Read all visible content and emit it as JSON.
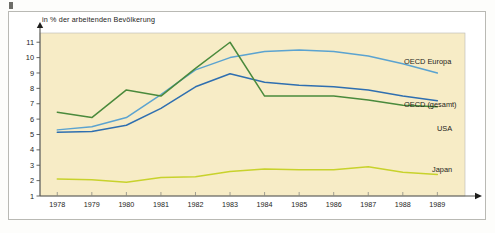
{
  "figure": {
    "corner_mark": "figure-marker",
    "background_color": "#ffffff",
    "plot_background_color": "#f7ecc6",
    "frame_color": "#b9b9b4"
  },
  "chart_data": {
    "type": "line",
    "title": "",
    "subtitle": "",
    "ylabel": "in % der arbeitenden Bevölkerung",
    "xlabel": "",
    "x": [
      1978,
      1979,
      1980,
      1981,
      1982,
      1983,
      1984,
      1985,
      1986,
      1987,
      1988,
      1989
    ],
    "categories": [
      "1978",
      "1979",
      "1980",
      "1981",
      "1982",
      "1983",
      "1984",
      "1985",
      "1986",
      "1987",
      "1988",
      "1989"
    ],
    "ylim": [
      1,
      11.6
    ],
    "xlim": [
      1977.5,
      1989.8
    ],
    "yticks": [
      1,
      2,
      3,
      4,
      5,
      6,
      7,
      8,
      9,
      10,
      11
    ],
    "ytick_labels": [
      "1",
      "2",
      "3",
      "4",
      "5",
      "6",
      "7",
      "8",
      "9",
      "10",
      "11"
    ],
    "grid": false,
    "legend_position": "inline-right",
    "series": [
      {
        "name": "OECD Europa",
        "label": "OECD Europa",
        "color": "#5ba3d0",
        "values": [
          5.3,
          5.5,
          6.1,
          7.6,
          9.2,
          10.0,
          10.4,
          10.5,
          10.4,
          10.1,
          9.6,
          9.0
        ]
      },
      {
        "name": "OECD (gesamt)",
        "label": "OECD (gesamt)",
        "color": "#2f6fb0",
        "values": [
          5.15,
          5.2,
          5.6,
          6.7,
          8.1,
          8.95,
          8.4,
          8.2,
          8.1,
          7.9,
          7.5,
          7.2
        ]
      },
      {
        "name": "USA",
        "label": "USA",
        "color": "#4a8a3c",
        "values": [
          6.45,
          6.1,
          7.9,
          7.5,
          9.3,
          11.0,
          7.5,
          7.5,
          7.5,
          7.25,
          6.9,
          6.8
        ]
      },
      {
        "name": "Japan",
        "label": "Japan",
        "color": "#c8d22c",
        "values": [
          2.1,
          2.05,
          1.9,
          2.2,
          2.25,
          2.6,
          2.75,
          2.7,
          2.7,
          2.9,
          2.55,
          2.4
        ]
      }
    ]
  }
}
